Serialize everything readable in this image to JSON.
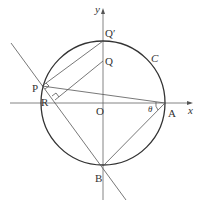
{
  "figure": {
    "axes": {
      "x_label": "x",
      "y_label": "y",
      "origin_label": "O"
    },
    "circle": {
      "label": "C"
    },
    "points": {
      "P": "P",
      "Q": "Q",
      "Q_prime": "Q′",
      "R": "R",
      "A": "A",
      "B": "B"
    },
    "angle_label": "θ"
  }
}
